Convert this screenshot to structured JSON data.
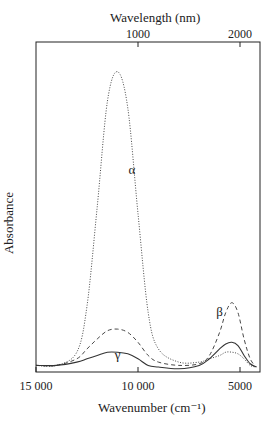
{
  "chart_data": {
    "type": "line",
    "title": "",
    "xlabel": "Wavenumber (cm⁻¹)",
    "ylabel": "Absorbance",
    "x2label": "Wavelength (nm)",
    "xlim": [
      15000,
      4000
    ],
    "ylim": [
      0,
      1
    ],
    "x_ticks": [
      {
        "value": 15000,
        "label": "15 000"
      },
      {
        "value": 10000,
        "label": "10 000"
      },
      {
        "value": 5000,
        "label": "5000"
      }
    ],
    "x2_ticks": [
      {
        "value": 1000,
        "label": "1000"
      },
      {
        "value": 2000,
        "label": "2000"
      }
    ],
    "y_ticks": [],
    "grid": false,
    "legend": "inline labels",
    "x": [
      15000,
      14000,
      13000,
      12500,
      12000,
      11500,
      11000,
      10500,
      10000,
      9500,
      9000,
      8000,
      7000,
      6500,
      6000,
      5700,
      5400,
      5100,
      4800,
      4500,
      4200
    ],
    "series": [
      {
        "name": "α",
        "style": "dotted",
        "values": [
          0.02,
          0.02,
          0.06,
          0.2,
          0.5,
          0.82,
          0.91,
          0.8,
          0.48,
          0.18,
          0.07,
          0.03,
          0.03,
          0.04,
          0.05,
          0.06,
          0.06,
          0.055,
          0.04,
          0.02,
          0.015
        ]
      },
      {
        "name": "β",
        "style": "dashed",
        "values": [
          0.02,
          0.02,
          0.04,
          0.07,
          0.1,
          0.125,
          0.13,
          0.12,
          0.09,
          0.05,
          0.03,
          0.02,
          0.025,
          0.05,
          0.12,
          0.18,
          0.21,
          0.18,
          0.1,
          0.04,
          0.015
        ]
      },
      {
        "name": "γ",
        "style": "solid",
        "values": [
          0.02,
          0.02,
          0.03,
          0.04,
          0.05,
          0.06,
          0.06,
          0.055,
          0.04,
          0.02,
          0.015,
          0.01,
          0.02,
          0.04,
          0.07,
          0.085,
          0.09,
          0.08,
          0.05,
          0.025,
          0.015
        ]
      }
    ],
    "annotations": [
      {
        "text": "α",
        "x": 10300,
        "y": 0.6
      },
      {
        "text": "β",
        "x": 6000,
        "y": 0.17
      },
      {
        "text": "γ",
        "x": 11000,
        "y": 0.04
      }
    ]
  }
}
